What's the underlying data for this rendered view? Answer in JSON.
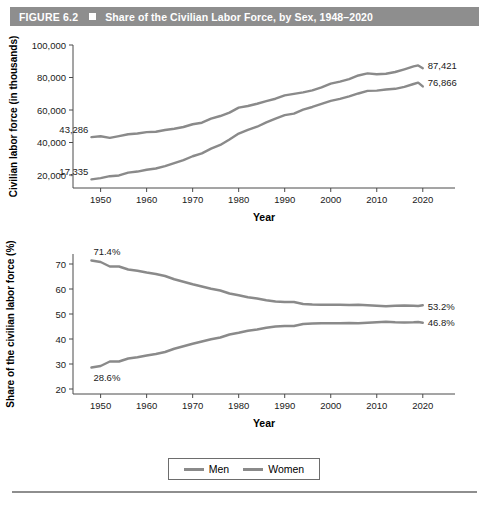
{
  "header": {
    "figure_number": "FIGURE 6.2",
    "title": "Share of the Civilian Labor Force, by Sex, 1948–2020"
  },
  "legend": {
    "items": [
      {
        "label": "Men",
        "color": "#8a8a8a"
      },
      {
        "label": "Women",
        "color": "#8a8a8a"
      }
    ]
  },
  "colors": {
    "header_bar": "#8e8e8e",
    "line": "#8a8a8a",
    "axis": "#4a4a4a",
    "footer_rule": "#8e8e8e"
  },
  "chart_data": [
    {
      "type": "line",
      "id": "counts",
      "title": "",
      "xlabel": "Year",
      "ylabel": "Civilian labor force (in thousands)",
      "xlim": [
        1944,
        2027
      ],
      "ylim": [
        12000,
        100000
      ],
      "xticks": [
        1950,
        1960,
        1970,
        1980,
        1990,
        2000,
        2010,
        2020
      ],
      "xticklabels": [
        "1950",
        "1960",
        "1970",
        "1980",
        "1990",
        "2000",
        "2010",
        "2020"
      ],
      "yticks": [
        20000,
        40000,
        60000,
        80000,
        100000
      ],
      "yticklabels": [
        "20,000",
        "40,000",
        "60,000",
        "80,000",
        "100,000"
      ],
      "grid": false,
      "legend_position": "below-figure",
      "annotations": [
        {
          "text": "43,286",
          "series": "Men",
          "x": 1948,
          "y": 43286,
          "anchor": "start-left"
        },
        {
          "text": "17,335",
          "series": "Women",
          "x": 1948,
          "y": 17335,
          "anchor": "start-left"
        },
        {
          "text": "87,421",
          "series": "Men",
          "x": 2020,
          "y": 87421,
          "anchor": "end-right"
        },
        {
          "text": "76,866",
          "series": "Women",
          "x": 2020,
          "y": 76866,
          "anchor": "end-right"
        }
      ],
      "x": [
        1948,
        1950,
        1952,
        1954,
        1956,
        1958,
        1960,
        1962,
        1964,
        1966,
        1968,
        1970,
        1972,
        1974,
        1976,
        1978,
        1980,
        1982,
        1984,
        1986,
        1988,
        1990,
        1992,
        1994,
        1996,
        1998,
        2000,
        2002,
        2004,
        2006,
        2008,
        2010,
        2012,
        2014,
        2016,
        2018,
        2019,
        2020
      ],
      "series": [
        {
          "name": "Men",
          "values": [
            43286,
            43819,
            42869,
            43965,
            45091,
            45521,
            46388,
            46600,
            47679,
            48471,
            49533,
            51228,
            52180,
            54650,
            56299,
            58396,
            61453,
            62450,
            63835,
            65422,
            66927,
            69011,
            69964,
            70817,
            72087,
            73959,
            76280,
            77500,
            78980,
            81255,
            82520,
            81985,
            82327,
            83373,
            85044,
            86800,
            87421,
            85700
          ],
          "color": "#8a8a8a"
        },
        {
          "name": "Women",
          "values": [
            17335,
            18063,
            19269,
            19718,
            21461,
            22118,
            23240,
            24000,
            25412,
            27333,
            29204,
            31543,
            33320,
            36211,
            38520,
            41878,
            45487,
            47755,
            49709,
            52413,
            54742,
            56829,
            57798,
            60239,
            61857,
            63714,
            65616,
            66848,
            68421,
            70173,
            71767,
            71904,
            72648,
            73039,
            74260,
            76000,
            76866,
            74500
          ],
          "color": "#8a8a8a"
        }
      ]
    },
    {
      "type": "line",
      "id": "shares",
      "title": "",
      "xlabel": "Year",
      "ylabel": "Share of the civilian labor force (%)",
      "xlim": [
        1944,
        2027
      ],
      "ylim": [
        18,
        74
      ],
      "xticks": [
        1950,
        1960,
        1970,
        1980,
        1990,
        2000,
        2010,
        2020
      ],
      "xticklabels": [
        "1950",
        "1960",
        "1970",
        "1980",
        "1990",
        "2000",
        "2010",
        "2020"
      ],
      "yticks": [
        20,
        30,
        40,
        50,
        60,
        70
      ],
      "yticklabels": [
        "20",
        "30",
        "40",
        "50",
        "60",
        "70"
      ],
      "grid": false,
      "legend_position": "below-figure",
      "annotations": [
        {
          "text": "71.4%",
          "series": "Men",
          "x": 1948,
          "y": 71.4,
          "anchor": "start-above"
        },
        {
          "text": "28.6%",
          "series": "Women",
          "x": 1948,
          "y": 28.6,
          "anchor": "start-below"
        },
        {
          "text": "53.2%",
          "series": "Men",
          "x": 2020,
          "y": 53.2,
          "anchor": "end-right"
        },
        {
          "text": "46.8%",
          "series": "Women",
          "x": 2020,
          "y": 46.8,
          "anchor": "end-right"
        }
      ],
      "x": [
        1948,
        1950,
        1952,
        1954,
        1956,
        1958,
        1960,
        1962,
        1964,
        1966,
        1968,
        1970,
        1972,
        1974,
        1976,
        1978,
        1980,
        1982,
        1984,
        1986,
        1988,
        1990,
        1992,
        1994,
        1996,
        1998,
        2000,
        2002,
        2004,
        2006,
        2008,
        2010,
        2012,
        2014,
        2016,
        2018,
        2019,
        2020
      ],
      "series": [
        {
          "name": "Men",
          "values": [
            71.4,
            70.8,
            69.0,
            69.0,
            67.8,
            67.3,
            66.6,
            66.0,
            65.2,
            63.9,
            62.9,
            61.9,
            61.0,
            60.1,
            59.4,
            58.2,
            57.5,
            56.7,
            56.2,
            55.5,
            55.0,
            54.8,
            54.8,
            54.0,
            53.8,
            53.7,
            53.7,
            53.7,
            53.6,
            53.7,
            53.5,
            53.3,
            53.1,
            53.3,
            53.4,
            53.3,
            53.2,
            53.5
          ],
          "color": "#8a8a8a"
        },
        {
          "name": "Women",
          "values": [
            28.6,
            29.2,
            31.0,
            31.0,
            32.2,
            32.7,
            33.4,
            34.0,
            34.8,
            36.1,
            37.1,
            38.1,
            39.0,
            39.9,
            40.6,
            41.8,
            42.5,
            43.3,
            43.8,
            44.5,
            45.0,
            45.2,
            45.2,
            46.0,
            46.2,
            46.3,
            46.3,
            46.3,
            46.4,
            46.3,
            46.5,
            46.7,
            46.9,
            46.7,
            46.6,
            46.7,
            46.8,
            46.5
          ],
          "color": "#8a8a8a"
        }
      ]
    }
  ]
}
